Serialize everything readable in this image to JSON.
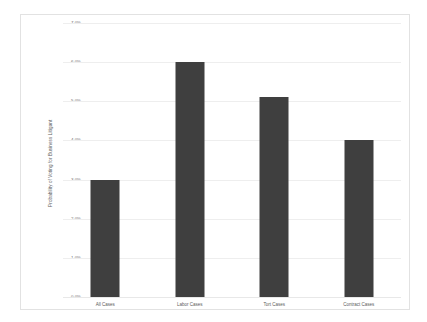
{
  "chart_data": {
    "type": "bar",
    "title": "",
    "subtitle": "",
    "xlabel": "",
    "ylabel": "Probability of Voting for Business Litigant",
    "categories": [
      "All Cases",
      "Labor Cases",
      "Tort Cases",
      "Contract Cases"
    ],
    "values": [
      3.0,
      6.0,
      5.1,
      4.0
    ],
    "value_labels": [
      "3.0%",
      "6.0%",
      "5.1%",
      "4.0%"
    ],
    "ylim": [
      0,
      7
    ],
    "y_tick_values": [
      0,
      1,
      2,
      3,
      4,
      5,
      6,
      7
    ],
    "y_tick_labels": [
      "0.0%",
      "1.0%",
      "2.0%",
      "3.0%",
      "4.0%",
      "5.0%",
      "6.0%",
      "7.0%"
    ],
    "grid": true,
    "legend": false,
    "legend_position": "none",
    "series": [
      {
        "name": "Probability of Voting for Business Litigant",
        "values": [
          3.0,
          6.0,
          5.1,
          4.0
        ]
      }
    ],
    "colors": {
      "bar": "#3f3f3f",
      "gridline": "#eeeeee",
      "frame": "#e2e2e2",
      "background": "#ffffff",
      "text": "#5a5a5a"
    }
  }
}
